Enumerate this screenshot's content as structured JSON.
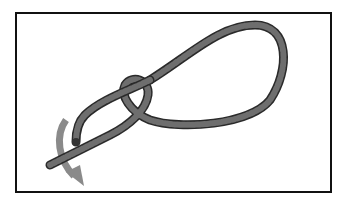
{
  "figure": {
    "rope_color": "#6e6e6e",
    "rope_outline": "#2a2a2a",
    "arrow_color": "#8a8a8a",
    "frame_color": "#111111",
    "arrow_direction": "downward curve"
  }
}
